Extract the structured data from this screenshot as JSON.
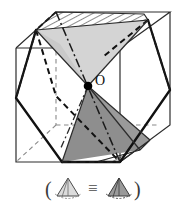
{
  "figure": {
    "center_label": "O",
    "colors": {
      "outline": "#1a1a1a",
      "thin_edge": "#3c3c3c",
      "hidden_edge": "#7d7d7d",
      "light_pyramid_fill": "#d2d2d2",
      "dark_pyramid_fill": "#8e8e8e",
      "hatch_stroke": "#2a2a2a",
      "point_fill": "#000000",
      "background": "#ffffff"
    },
    "parts": {
      "cube_label": "cube",
      "upper_pyramid_label": "upper-pyramid",
      "lower_pyramid_label": "lower-pyramid",
      "hexagon_section_label": "hexagonal-cross-section",
      "axis_label": "dash-dot-axis",
      "center_point_label": "center-point-O"
    }
  },
  "caption": {
    "open_paren": "(",
    "close_paren": ")",
    "equiv_symbol": "≡",
    "left_icon_name": "light-pyramid-icon",
    "right_icon_name": "dark-pyramid-icon",
    "left_icon_fill": "#d8d8d8",
    "right_icon_fill": "#9a9a9a"
  }
}
